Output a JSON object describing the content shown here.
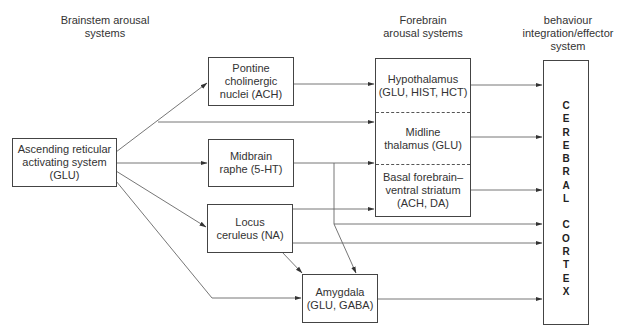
{
  "headers": {
    "brainstem": [
      "Brainstem arousal",
      "systems"
    ],
    "forebrain": [
      "Forebrain",
      "arousal systems"
    ],
    "behaviour": [
      "behaviour",
      "integration/effector",
      "system"
    ]
  },
  "nodes": {
    "aras": [
      "Ascending reticular",
      "activating system",
      "(GLU)"
    ],
    "pontine": [
      "Pontine",
      "cholinergic",
      "nuclei (ACH)"
    ],
    "raphe": [
      "Midbrain",
      "raphe (5-HT)"
    ],
    "locus": [
      "Locus",
      "ceruleus (NA)"
    ],
    "amygdala": [
      "Amygdala",
      "(GLU, GABA)"
    ],
    "forebrain_sections": {
      "hypothalamus": [
        "Hypothalamus",
        "(GLU, HIST, HCT)"
      ],
      "thalamus": [
        "Midline",
        "thalamus (GLU)"
      ],
      "basal": [
        "Basal forebrain–",
        "ventral striatum",
        "(ACH, DA)"
      ]
    },
    "cortex_letters": [
      "C",
      "E",
      "R",
      "E",
      "B",
      "R",
      "A",
      "L",
      "",
      "C",
      "O",
      "R",
      "T",
      "E",
      "X"
    ]
  },
  "edges": [
    {
      "from": "aras",
      "to": "pontine"
    },
    {
      "from": "aras",
      "to": "thalamus"
    },
    {
      "from": "aras",
      "to": "raphe"
    },
    {
      "from": "aras",
      "to": "locus"
    },
    {
      "from": "aras",
      "to": "amygdala"
    },
    {
      "from": "pontine",
      "to": "hypothalamus"
    },
    {
      "from": "raphe",
      "to": "basal"
    },
    {
      "from": "raphe",
      "to": "cortex"
    },
    {
      "from": "raphe",
      "to": "amygdala"
    },
    {
      "from": "locus",
      "to": "basal"
    },
    {
      "from": "locus",
      "to": "cortex"
    },
    {
      "from": "locus",
      "to": "amygdala"
    },
    {
      "from": "hypothalamus",
      "to": "cortex"
    },
    {
      "from": "thalamus",
      "to": "cortex"
    },
    {
      "from": "basal",
      "to": "cortex"
    },
    {
      "from": "amygdala",
      "to": "cortex"
    }
  ],
  "colors": {
    "line": "#555555",
    "border": "#444444",
    "text": "#333333"
  }
}
